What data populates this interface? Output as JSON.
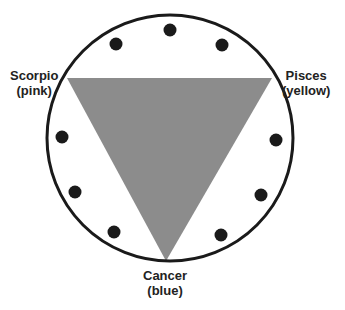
{
  "diagram": {
    "type": "circle-with-inscribed-triangle",
    "colors": {
      "circle_stroke": "#1a1a1a",
      "triangle_fill": "#8c8c8c",
      "dot_fill": "#1a1a1a",
      "background": "#ffffff"
    },
    "circle": {
      "cx": 170,
      "cy": 138,
      "r": 123
    },
    "triangle": {
      "points": [
        [
          67,
          78
        ],
        [
          272,
          78
        ],
        [
          166,
          261
        ]
      ]
    },
    "dots": [
      {
        "cx": 170,
        "cy": 30
      },
      {
        "cx": 116,
        "cy": 44
      },
      {
        "cx": 222,
        "cy": 45
      },
      {
        "cx": 62,
        "cy": 137
      },
      {
        "cx": 75,
        "cy": 192
      },
      {
        "cx": 114,
        "cy": 232
      },
      {
        "cx": 276,
        "cy": 140
      },
      {
        "cx": 261,
        "cy": 195
      },
      {
        "cx": 221,
        "cy": 235
      }
    ],
    "labels": {
      "scorpio": {
        "name": "Scorpio",
        "color_note": "(pink)"
      },
      "pisces": {
        "name": "Pisces",
        "color_note": "(yellow)"
      },
      "cancer": {
        "name": "Cancer",
        "color_note": "(blue)"
      }
    }
  }
}
